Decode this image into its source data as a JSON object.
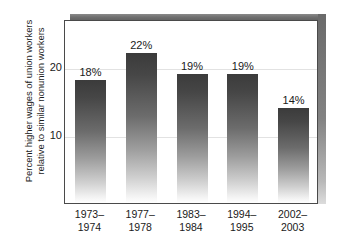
{
  "chart_data": {
    "type": "bar",
    "title": "",
    "subtitle": "",
    "xlabel": "",
    "ylabel_line1": "Percent higher wages of union workers",
    "ylabel_line2": "relative to similar nonunion workers",
    "categories": [
      "1973–\n1974",
      "1977–\n1978",
      "1983–\n1984",
      "1994–\n1995",
      "2002–\n2003"
    ],
    "category_lines": [
      [
        "1973–",
        "1974"
      ],
      [
        "1977–",
        "1978"
      ],
      [
        "1983–",
        "1984"
      ],
      [
        "1994–",
        "1995"
      ],
      [
        "2002–",
        "2003"
      ]
    ],
    "values": [
      18,
      22,
      19,
      19,
      14
    ],
    "data_labels": [
      "18%",
      "22%",
      "19%",
      "19%",
      "14%"
    ],
    "ylim": [
      0,
      27
    ],
    "yticks": [
      10,
      20
    ],
    "ytick_labels": [
      "10",
      "20"
    ],
    "grid": true,
    "grid_axis": "y",
    "legend": null,
    "bar_color_top": "#3b3b3b",
    "bar_color_bottom": "#ffffff",
    "frame_color": "#4a4a4a",
    "shadow_color": "#6f6f6f",
    "gridline_color": "#e2e2e2"
  }
}
